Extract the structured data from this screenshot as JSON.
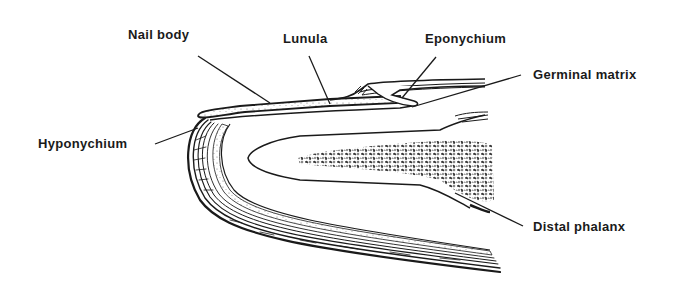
{
  "figure": {
    "style": "black ink line drawing on white background",
    "colors": {
      "ink": "#1a1a1a",
      "background": "#ffffff"
    }
  },
  "labels": {
    "nail_body": "Nail body",
    "lunula": "Lunula",
    "eponychium": "Eponychium",
    "germinal_matrix": "Germinal matrix",
    "hyponychium": "Hyponychium",
    "distal_phalanx": "Distal phalanx"
  }
}
